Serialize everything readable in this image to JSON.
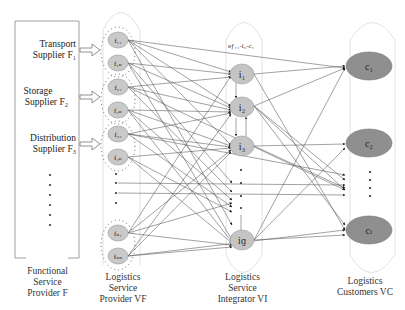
{
  "colors": {
    "f_node_fill": "#c9c9c9",
    "i_node_fill": "#c4c4c4",
    "c_node_fill": "#8f8f8f",
    "edge": "#555555",
    "group_outline": "#dddddd",
    "box": "#888888"
  },
  "functional_provider": {
    "suppliers": [
      {
        "line1": "Transport",
        "line2": "Supplier F₁"
      },
      {
        "line1": "Storage",
        "line2": "Supplier F₂"
      },
      {
        "line1": "Distribution",
        "line2": "Supplier F₃"
      }
    ],
    "label": [
      "Functional",
      "Service",
      "Provider F"
    ]
  },
  "service_providers": {
    "nodes": [
      "f₁₁",
      "f₁ₙ",
      "f₂₁",
      "f₂ₙ",
      "f₃₁",
      "f₃ₙ",
      "fₙ₁",
      "fₙₙ"
    ],
    "label": [
      "Logistics",
      "Service",
      "Provider VF"
    ]
  },
  "integrators": {
    "nodes": [
      "i₁",
      "i₂",
      "i₃",
      "iɡ"
    ],
    "label": [
      "Logistics",
      "Service",
      "Integrator VI"
    ]
  },
  "customers": {
    "nodes": [
      "c₁",
      "c₂",
      "cₗ"
    ],
    "label": [
      "Logistics",
      "Customers VC"
    ]
  },
  "edge_label": "eƒ₁₁-i₀-c₁"
}
